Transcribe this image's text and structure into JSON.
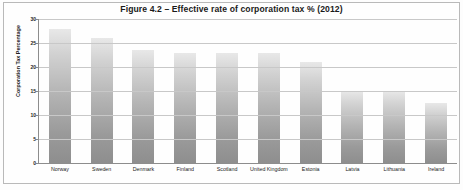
{
  "figure": {
    "title": "Figure 4.2 – Effective rate of corporation tax % (2012)"
  },
  "chart_data": {
    "type": "bar",
    "title": "Figure 4.2 – Effective rate of corporation tax % (2012)",
    "xlabel": "",
    "ylabel": "Corporation Tax Percentage",
    "categories": [
      "Norway",
      "Sweden",
      "Denmark",
      "Finland",
      "Scotland",
      "United Kingdom",
      "Estonia",
      "Latvia",
      "Lithuania",
      "Ireland"
    ],
    "values": [
      28,
      26,
      23.5,
      23,
      23,
      23,
      21,
      15,
      15,
      12.5
    ],
    "ylim": [
      0,
      30
    ],
    "yticks": [
      0,
      5,
      10,
      15,
      20,
      25,
      30
    ],
    "ytick_labels": [
      "0",
      "5",
      "10",
      "15",
      "20",
      "25",
      "30"
    ],
    "grid": true,
    "legend": "none",
    "bar_color": "#b4b4b4"
  }
}
